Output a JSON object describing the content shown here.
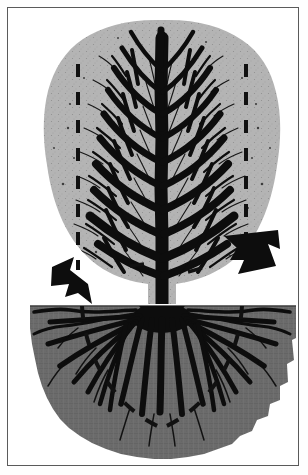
{
  "figure": {
    "style": "black-and-white line illustration, halftone shading",
    "caption": "",
    "colors": {
      "background": "#ffffff",
      "frame_border": "#5a5a5a",
      "canopy_fill": "#b2b2b2",
      "canopy_fill_dark": "#a3a3a3",
      "soil_fill": "#6b6b6b",
      "soil_fill_dark": "#5f5f5f",
      "ink_black": "#0d0d0d",
      "dash_line": "#111111"
    },
    "frame": {
      "x": 7,
      "y": 7,
      "width": 292,
      "height": 459,
      "stroke_width": 1
    }
  },
  "scene": {
    "ground_line_y": 296,
    "trunk_center_x": 154,
    "regions": [
      {
        "name": "canopy-region",
        "label": "Crown / canopy",
        "top": 12,
        "bottom": 296
      },
      {
        "name": "soil-region",
        "label": "Soil / root zone",
        "top": 296,
        "bottom": 452
      }
    ]
  },
  "canopy": {
    "name": "tree-canopy",
    "description": "Broad ovate crown of fine black branching over light gray leaf mass",
    "extent": {
      "left": 36,
      "right": 272,
      "top": 12,
      "bottom": 296
    },
    "dripline_markers": [
      {
        "name": "dripline-left",
        "x": 70,
        "from_y": 56,
        "to_y": 262
      },
      {
        "name": "dripline-right",
        "x": 238,
        "from_y": 56,
        "to_y": 262
      }
    ],
    "tick_marks": [
      {
        "name": "canopy-tick-left",
        "x": 128,
        "y": 257
      },
      {
        "name": "canopy-tick-right",
        "x": 186,
        "y": 262
      }
    ]
  },
  "roots": {
    "name": "root-system",
    "description": "Radiating fan of black lateral roots spreading from root crown",
    "extent": {
      "left": 22,
      "right": 288,
      "top": 296,
      "bottom": 452
    },
    "spread_markers": [
      {
        "name": "root-spread-arc-left",
        "label": "dashed arc, left half"
      },
      {
        "name": "root-spread-arc-right",
        "label": "dashed arc, right half"
      }
    ],
    "lateral_count": 18
  },
  "arrows": [
    {
      "name": "arrow-to-soil-left",
      "label": "",
      "points_to": "soil surface / root zone",
      "direction": "down-right",
      "tip": {
        "x": 79,
        "y": 296
      },
      "tail": {
        "x": 47,
        "y": 261
      }
    },
    {
      "name": "arrow-to-canopy-right",
      "label": "",
      "points_to": "canopy edge / drip line",
      "direction": "up-left",
      "tip": {
        "x": 214,
        "y": 232
      },
      "tail": {
        "x": 262,
        "y": 262
      }
    }
  ]
}
